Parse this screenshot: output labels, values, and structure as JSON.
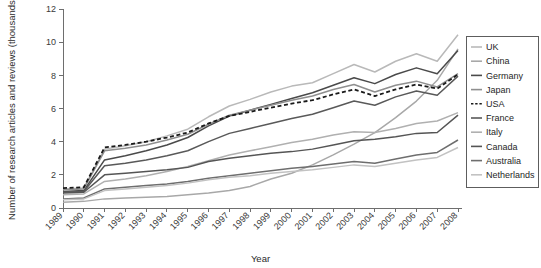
{
  "chart_data": {
    "type": "line",
    "title": "",
    "xlabel": "Year",
    "ylabel": "Number of research articles and reviews (thousands)",
    "x": [
      1989,
      1990,
      1991,
      1992,
      1993,
      1994,
      1995,
      1996,
      1997,
      1998,
      1999,
      2000,
      2001,
      2002,
      2003,
      2004,
      2005,
      2006,
      2007,
      2008
    ],
    "xlim": [
      1989,
      2008
    ],
    "ylim": [
      0,
      12
    ],
    "yticks": [
      0,
      2,
      4,
      6,
      8,
      10,
      12
    ],
    "xtick_labels": [
      "1989",
      "1990",
      "1991",
      "1992",
      "1993",
      "1994",
      "1995",
      "1996",
      "1997",
      "1998",
      "1999",
      "2000",
      "2001",
      "2002",
      "2003",
      "2004",
      "2005",
      "2006",
      "2007",
      "2008"
    ],
    "grid": false,
    "legend_position": "right",
    "series": [
      {
        "name": "UK",
        "color": "#b9b9b9",
        "dash": "none",
        "width": 1.5,
        "values": [
          1.15,
          1.2,
          3.55,
          3.75,
          4.0,
          4.35,
          4.75,
          5.5,
          6.15,
          6.55,
          7.0,
          7.35,
          7.55,
          8.1,
          8.65,
          8.2,
          8.85,
          9.3,
          8.85,
          10.45
        ]
      },
      {
        "name": "China",
        "color": "#a8a8a8",
        "dash": "none",
        "width": 1.5,
        "values": [
          0.35,
          0.4,
          0.55,
          0.6,
          0.65,
          0.7,
          0.8,
          0.9,
          1.05,
          1.3,
          1.75,
          2.1,
          2.6,
          3.2,
          3.85,
          4.55,
          5.45,
          6.45,
          7.7,
          9.6
        ]
      },
      {
        "name": "Germany",
        "color": "#4a4a4a",
        "dash": "none",
        "width": 1.5,
        "values": [
          1.0,
          1.05,
          2.9,
          3.15,
          3.45,
          3.8,
          4.25,
          4.95,
          5.55,
          5.9,
          6.25,
          6.6,
          6.95,
          7.4,
          7.85,
          7.5,
          8.05,
          8.45,
          8.1,
          9.5
        ]
      },
      {
        "name": "Japan",
        "color": "#8f8f8f",
        "dash": "none",
        "width": 1.5,
        "values": [
          1.1,
          1.15,
          3.45,
          3.6,
          3.8,
          4.1,
          4.45,
          5.05,
          5.6,
          5.9,
          6.2,
          6.5,
          6.75,
          7.15,
          7.45,
          7.0,
          7.4,
          7.65,
          7.3,
          8.1
        ]
      },
      {
        "name": "USA",
        "color": "#1a1a1a",
        "dash": "dashed",
        "width": 1.8,
        "values": [
          1.2,
          1.25,
          3.65,
          3.8,
          4.0,
          4.25,
          4.55,
          5.1,
          5.55,
          5.8,
          6.05,
          6.3,
          6.5,
          6.85,
          7.15,
          6.75,
          7.15,
          7.45,
          7.2,
          8.05
        ]
      },
      {
        "name": "France",
        "color": "#595959",
        "dash": "none",
        "width": 1.5,
        "values": [
          0.95,
          1.0,
          2.55,
          2.7,
          2.9,
          3.15,
          3.45,
          4.0,
          4.5,
          4.8,
          5.1,
          5.4,
          5.65,
          6.05,
          6.45,
          6.2,
          6.7,
          7.05,
          6.8,
          7.95
        ]
      },
      {
        "name": "Italy",
        "color": "#b0b0b0",
        "dash": "none",
        "width": 1.5,
        "values": [
          0.8,
          0.85,
          1.6,
          1.75,
          1.95,
          2.2,
          2.5,
          2.85,
          3.2,
          3.45,
          3.7,
          3.95,
          4.15,
          4.4,
          4.6,
          4.55,
          4.8,
          5.1,
          5.25,
          5.75
        ]
      },
      {
        "name": "Canada",
        "color": "#555555",
        "dash": "none",
        "width": 1.5,
        "values": [
          0.9,
          0.95,
          2.0,
          2.1,
          2.2,
          2.3,
          2.45,
          2.8,
          3.0,
          3.15,
          3.3,
          3.4,
          3.55,
          3.8,
          4.05,
          4.15,
          4.3,
          4.5,
          4.55,
          5.6
        ]
      },
      {
        "name": "Australia",
        "color": "#6e6e6e",
        "dash": "none",
        "width": 1.5,
        "values": [
          0.55,
          0.6,
          1.15,
          1.25,
          1.35,
          1.45,
          1.6,
          1.8,
          1.95,
          2.1,
          2.25,
          2.4,
          2.5,
          2.65,
          2.8,
          2.7,
          2.95,
          3.2,
          3.35,
          4.1
        ]
      },
      {
        "name": "Netherlands",
        "color": "#c2c2c2",
        "dash": "none",
        "width": 1.5,
        "values": [
          0.5,
          0.55,
          1.05,
          1.15,
          1.25,
          1.35,
          1.5,
          1.7,
          1.85,
          1.95,
          2.1,
          2.2,
          2.3,
          2.45,
          2.6,
          2.5,
          2.7,
          2.9,
          3.05,
          3.65
        ]
      }
    ]
  }
}
